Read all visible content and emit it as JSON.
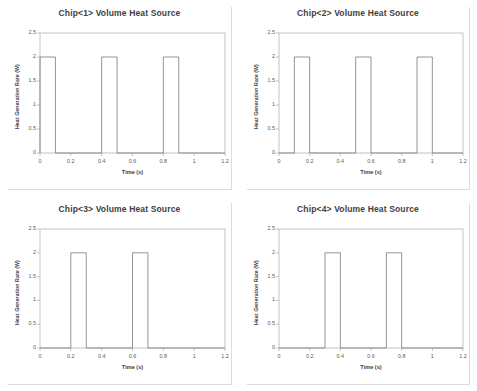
{
  "figure": {
    "layout": "2x2-grid",
    "background_color": "#ffffff",
    "frame_color": "#d9d9d9",
    "divider_color": "#c8c8c8"
  },
  "chart_data": [
    {
      "type": "line",
      "title": "Chip<1> Volume Heat Source",
      "xlabel": "Time (s)",
      "ylabel": "Heat Generation Rate (W)",
      "xlim": [
        0,
        1.2
      ],
      "ylim": [
        0,
        2.5
      ],
      "xticks": [
        0,
        0.2,
        0.4,
        0.6,
        0.8,
        1,
        1.2
      ],
      "xticklabels": [
        "0",
        "0.2",
        "0.4",
        "0.6",
        "0.8",
        "1",
        "1.2"
      ],
      "yticks": [
        0,
        0.5,
        1,
        1.5,
        2,
        2.5
      ],
      "yticklabels": [
        "0",
        "0.5",
        "1",
        "1.5",
        "2",
        "2.5"
      ],
      "grid": false,
      "legend": "none",
      "line_color": "#7a7a7a",
      "pulse_amplitude": 2,
      "pulses": [
        [
          0.0,
          0.1
        ],
        [
          0.4,
          0.5
        ],
        [
          0.8,
          0.9
        ]
      ],
      "x": [
        0,
        0,
        0.1,
        0.1,
        0.4,
        0.4,
        0.5,
        0.5,
        0.8,
        0.8,
        0.9,
        0.9,
        1.2
      ],
      "y": [
        0,
        2,
        2,
        0,
        0,
        2,
        2,
        0,
        0,
        2,
        2,
        0,
        0
      ]
    },
    {
      "type": "line",
      "title": "Chip<2> Volume Heat Source",
      "xlabel": "Time (s)",
      "ylabel": "Heat Generation Rate (W)",
      "xlim": [
        0,
        1.2
      ],
      "ylim": [
        0,
        2.5
      ],
      "xticks": [
        0,
        0.2,
        0.4,
        0.6,
        0.8,
        1,
        1.2
      ],
      "xticklabels": [
        "0",
        "0.2",
        "0.4",
        "0.6",
        "0.8",
        "1",
        "1.2"
      ],
      "yticks": [
        0,
        0.5,
        1,
        1.5,
        2,
        2.5
      ],
      "yticklabels": [
        "0",
        "0.5",
        "1",
        "1.5",
        "2",
        "2.5"
      ],
      "grid": false,
      "legend": "none",
      "line_color": "#7a7a7a",
      "pulse_amplitude": 2,
      "pulses": [
        [
          0.1,
          0.2
        ],
        [
          0.5,
          0.6
        ],
        [
          0.9,
          1.0
        ]
      ],
      "x": [
        0,
        0.1,
        0.1,
        0.2,
        0.2,
        0.5,
        0.5,
        0.6,
        0.6,
        0.9,
        0.9,
        1.0,
        1.0,
        1.2
      ],
      "y": [
        0,
        0,
        2,
        2,
        0,
        0,
        2,
        2,
        0,
        0,
        2,
        2,
        0,
        0
      ]
    },
    {
      "type": "line",
      "title": "Chip<3> Volume Heat Source",
      "xlabel": "Time (s)",
      "ylabel": "Heat Generation Rate (W)",
      "xlim": [
        0,
        1.2
      ],
      "ylim": [
        0,
        2.5
      ],
      "xticks": [
        0,
        0.2,
        0.4,
        0.6,
        0.8,
        1,
        1.2
      ],
      "xticklabels": [
        "0",
        "0.2",
        "0.4",
        "0.6",
        "0.8",
        "1",
        "1.2"
      ],
      "yticks": [
        0,
        0.5,
        1,
        1.5,
        2,
        2.5
      ],
      "yticklabels": [
        "0",
        "0.5",
        "1",
        "1.5",
        "2",
        "2.5"
      ],
      "grid": false,
      "legend": "none",
      "line_color": "#7a7a7a",
      "pulse_amplitude": 2,
      "pulses": [
        [
          0.2,
          0.3
        ],
        [
          0.6,
          0.7
        ]
      ],
      "x": [
        0,
        0.2,
        0.2,
        0.3,
        0.3,
        0.6,
        0.6,
        0.7,
        0.7,
        1.2
      ],
      "y": [
        0,
        0,
        2,
        2,
        0,
        0,
        2,
        2,
        0,
        0
      ]
    },
    {
      "type": "line",
      "title": "Chip<4> Volume Heat Source",
      "xlabel": "Time (s)",
      "ylabel": "Heat Generation Rate (W)",
      "xlim": [
        0,
        1.2
      ],
      "ylim": [
        0,
        2.5
      ],
      "xticks": [
        0,
        0.2,
        0.4,
        0.6,
        0.8,
        1,
        1.2
      ],
      "xticklabels": [
        "0",
        "0.2",
        "0.4",
        "0.6",
        "0.8",
        "1",
        "1.2"
      ],
      "yticks": [
        0,
        0.5,
        1,
        1.5,
        2,
        2.5
      ],
      "yticklabels": [
        "0",
        "0.5",
        "1",
        "1.5",
        "2",
        "2.5"
      ],
      "grid": false,
      "legend": "none",
      "line_color": "#7a7a7a",
      "pulse_amplitude": 2,
      "pulses": [
        [
          0.3,
          0.4
        ],
        [
          0.7,
          0.8
        ]
      ],
      "x": [
        0,
        0.3,
        0.3,
        0.4,
        0.4,
        0.7,
        0.7,
        0.8,
        0.8,
        1.2
      ],
      "y": [
        0,
        0,
        2,
        2,
        0,
        0,
        2,
        2,
        0,
        0
      ]
    }
  ]
}
